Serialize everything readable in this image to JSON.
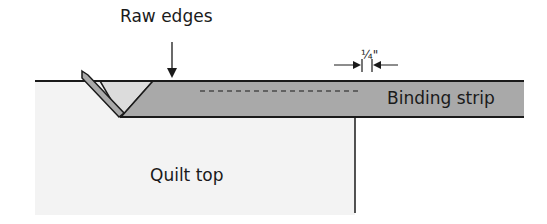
{
  "diagram": {
    "labels": {
      "raw_edges": "Raw edges",
      "measurement": "¼\"",
      "binding_strip": "Binding strip",
      "quilt_top": "Quilt top"
    },
    "colors": {
      "binding_fill": "#a9a9a9",
      "quilt_fill": "#f3f3f3",
      "fold_fill": "#dcdcdc",
      "line": "#1a1a1a"
    }
  }
}
